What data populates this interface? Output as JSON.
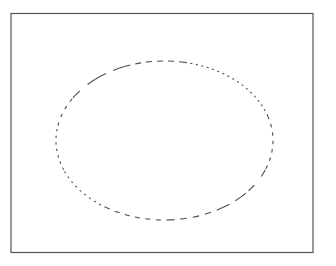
{
  "figure": {
    "canvas": {
      "width": 336,
      "height": 266,
      "background_color": "#ffffff"
    },
    "frame": {
      "label": "plot-border",
      "x": 11,
      "y": 13.5,
      "width": 302,
      "height": 239,
      "stroke_color": "#555555",
      "stroke_width": 1.2,
      "fill": "none",
      "style": "solid"
    },
    "ellipse": {
      "label": "dashed-ellipse",
      "center_x": 164.5,
      "center_y": 140.5,
      "radius_x": 108.5,
      "radius_y": 79.5,
      "left_extent": 56,
      "right_extent": 273,
      "top_extent": 61,
      "bottom_extent": 220,
      "stroke_color": "#4a4a55",
      "stroke_width": 1.1,
      "fill": "none",
      "style": "dashed",
      "dash_description": "Variable dash: long dashes in upper-left and lower-right arcs, fine dots along upper-right and left arcs",
      "segments": [
        {
          "name": "upper-right-fine-dots",
          "dash_array": "2 4"
        },
        {
          "name": "right-short-dashes",
          "dash_array": "4 5"
        },
        {
          "name": "lower-right-long-dash",
          "dash_array": "13 9"
        },
        {
          "name": "bottom-medium-dashes",
          "dash_array": "6 6"
        },
        {
          "name": "lower-left-fine-dots",
          "dash_array": "2 4"
        },
        {
          "name": "left-short-dashes",
          "dash_array": "3 5"
        },
        {
          "name": "upper-left-long-dash",
          "dash_array": "11 8"
        },
        {
          "name": "top-medium-dashes",
          "dash_array": "6 5"
        }
      ]
    }
  },
  "chart_data": {
    "type": "line",
    "title": "",
    "xlabel": "",
    "ylabel": "",
    "grid": false,
    "legend": "none",
    "xlim": [
      11,
      313
    ],
    "ylim": [
      13.5,
      252.5
    ],
    "annotations": [
      "Rectangular axes frame drawn with solid thin gray stroke",
      "Single closed elliptical curve drawn with a dashed / dotted stroke"
    ],
    "series": [
      {
        "name": "ellipse-outline",
        "shape": "ellipse",
        "center": [
          164.5,
          140.5
        ],
        "radii": [
          108.5,
          79.5
        ],
        "closed": true,
        "linestyle": "dashed",
        "color": "#4a4a55"
      }
    ]
  }
}
